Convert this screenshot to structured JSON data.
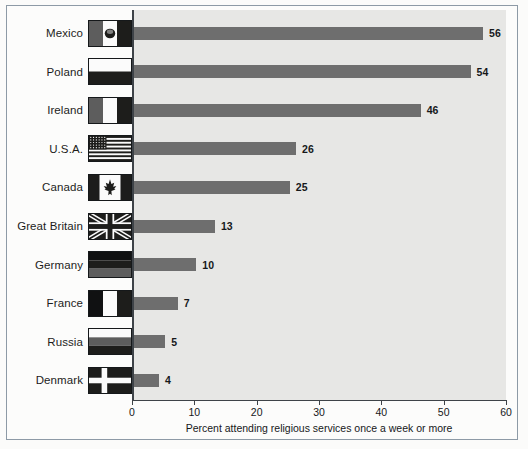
{
  "chart_data": {
    "type": "bar",
    "orientation": "horizontal",
    "title": "",
    "xlabel": "Percent attending religious services once a week or more",
    "ylabel": "",
    "xlim": [
      0,
      60
    ],
    "xticks": [
      0,
      10,
      20,
      30,
      40,
      50,
      60
    ],
    "grid": false,
    "legend": "none",
    "bar_color": "#6e6e6e",
    "plot_background": "#e7e7e5",
    "categories": [
      "Mexico",
      "Poland",
      "Ireland",
      "U.S.A.",
      "Canada",
      "Great Britain",
      "Germany",
      "France",
      "Russia",
      "Denmark"
    ],
    "values": [
      56,
      54,
      46,
      26,
      25,
      13,
      10,
      7,
      5,
      4
    ],
    "value_labels": [
      "56",
      "54",
      "46",
      "26",
      "25",
      "13",
      "10",
      "7",
      "5",
      "4"
    ],
    "series": [
      {
        "name": "Percent attending religious services once a week or more",
        "values": [
          56,
          54,
          46,
          26,
          25,
          13,
          10,
          7,
          5,
          4
        ]
      }
    ],
    "rows": [
      {
        "label": "Mexico",
        "value": 56,
        "value_label": "56",
        "flag": "flag-mexico"
      },
      {
        "label": "Poland",
        "value": 54,
        "value_label": "54",
        "flag": "flag-poland"
      },
      {
        "label": "Ireland",
        "value": 46,
        "value_label": "46",
        "flag": "flag-ireland"
      },
      {
        "label": "U.S.A.",
        "value": 26,
        "value_label": "26",
        "flag": "flag-usa"
      },
      {
        "label": "Canada",
        "value": 25,
        "value_label": "25",
        "flag": "flag-canada"
      },
      {
        "label": "Great Britain",
        "value": 13,
        "value_label": "13",
        "flag": "flag-great-britain"
      },
      {
        "label": "Germany",
        "value": 10,
        "value_label": "10",
        "flag": "flag-germany"
      },
      {
        "label": "France",
        "value": 7,
        "value_label": "7",
        "flag": "flag-france"
      },
      {
        "label": "Russia",
        "value": 5,
        "value_label": "5",
        "flag": "flag-russia"
      },
      {
        "label": "Denmark",
        "value": 4,
        "value_label": "4",
        "flag": "flag-denmark"
      }
    ],
    "tick_labels": [
      "0",
      "10",
      "20",
      "30",
      "40",
      "50",
      "60"
    ]
  }
}
